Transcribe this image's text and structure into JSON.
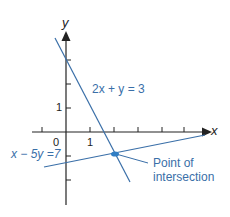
{
  "diagram": {
    "axes": {
      "x_label": "x",
      "y_label": "y",
      "origin_label": "0",
      "x_tick_label": "1",
      "y_tick_label": "1"
    },
    "lines": [
      {
        "equation": "2x + y = 3",
        "color": "#3a6fa8"
      },
      {
        "equation": "x − 5y =7",
        "color": "#3a6fa8"
      }
    ],
    "annotation": {
      "line1": "Point of",
      "line2": "intersection",
      "point": [
        2,
        -1
      ]
    },
    "colors": {
      "axis": "#222222",
      "accent": "#2f7dc4"
    }
  }
}
